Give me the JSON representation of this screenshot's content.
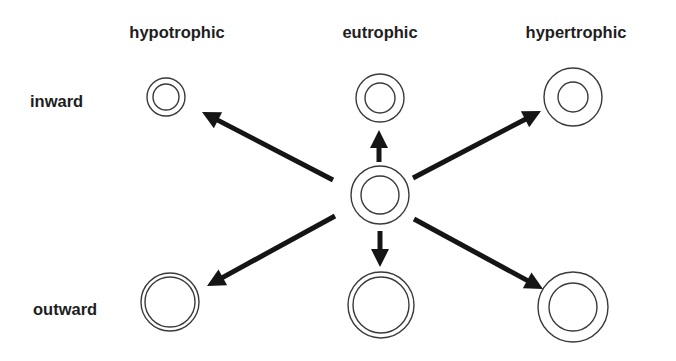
{
  "diagram": {
    "column_headers": [
      {
        "label": "hypotrophic",
        "x": 177
      },
      {
        "label": "eutrophic",
        "x": 380
      },
      {
        "label": "hypertrophic",
        "x": 576
      }
    ],
    "row_labels": [
      {
        "label": "inward",
        "y": 107
      },
      {
        "label": "outward",
        "y": 315
      }
    ],
    "center_vessel": {
      "cx": 380,
      "cy": 195,
      "outer_r": 29,
      "inner_r": 19
    },
    "vessels": [
      {
        "name": "hypotrophic-inward",
        "cx": 166,
        "cy": 97,
        "outer_r": 19,
        "inner_r": 13
      },
      {
        "name": "eutrophic-inward",
        "cx": 380,
        "cy": 98,
        "outer_r": 24,
        "inner_r": 15
      },
      {
        "name": "hypertrophic-inward",
        "cx": 573,
        "cy": 97,
        "outer_r": 29,
        "inner_r": 15
      },
      {
        "name": "hypotrophic-outward",
        "cx": 170,
        "cy": 302,
        "outer_r": 29,
        "inner_r": 25
      },
      {
        "name": "eutrophic-outward",
        "cx": 381,
        "cy": 305,
        "outer_r": 33,
        "inner_r": 28
      },
      {
        "name": "hypertrophic-outward",
        "cx": 573,
        "cy": 307,
        "outer_r": 35,
        "inner_r": 24
      }
    ],
    "arrows": [
      {
        "name": "to-hypotrophic-inward",
        "x1": 333,
        "y1": 180,
        "x2": 202,
        "y2": 112
      },
      {
        "name": "to-eutrophic-inward",
        "x1": 379,
        "y1": 162,
        "x2": 379,
        "y2": 130
      },
      {
        "name": "to-hypertrophic-inward",
        "x1": 413,
        "y1": 178,
        "x2": 541,
        "y2": 111
      },
      {
        "name": "to-hypotrophic-outward",
        "x1": 335,
        "y1": 216,
        "x2": 207,
        "y2": 286
      },
      {
        "name": "to-eutrophic-outward",
        "x1": 380,
        "y1": 231,
        "x2": 380,
        "y2": 267
      },
      {
        "name": "to-hypertrophic-outward",
        "x1": 414,
        "y1": 219,
        "x2": 543,
        "y2": 289
      }
    ],
    "colors": {
      "ring": "#3a3a3a",
      "arrow": "#151515",
      "text": "#1e1e1e",
      "background": "#ffffff"
    }
  }
}
